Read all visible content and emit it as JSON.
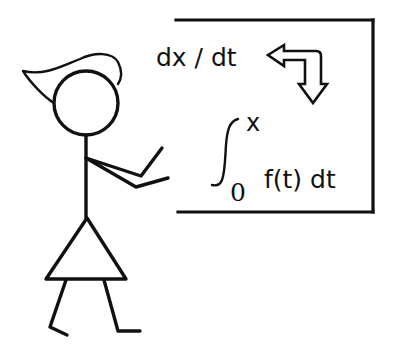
{
  "diagram": {
    "board": {
      "derivative_label": "dx / dt",
      "integral": {
        "symbol": "∫",
        "upper_limit": "x",
        "lower_limit": "0",
        "integrand": "f(t) dt"
      },
      "arrow": "bent-outline-arrow (left and down)"
    },
    "colors": {
      "ink": "#111111",
      "background": "#ffffff"
    }
  }
}
